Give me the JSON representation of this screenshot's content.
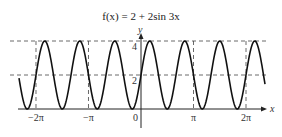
{
  "chart_data": {
    "type": "line",
    "title": "f(x) = 2 + 2sin 3x",
    "function": "2 + 2*sin(3*x)",
    "xlabel": "x",
    "ylabel": "y",
    "x_range": [
      -7.3,
      7.42
    ],
    "ylim": [
      0,
      4
    ],
    "x_ticks": [
      {
        "value": -6.2832,
        "label": "−2π"
      },
      {
        "value": -3.1416,
        "label": "−π"
      },
      {
        "value": 0,
        "label": "0"
      },
      {
        "value": 3.1416,
        "label": "π"
      },
      {
        "value": 6.2832,
        "label": "2π"
      }
    ],
    "y_ticks": [
      {
        "value": 2,
        "label": "2"
      },
      {
        "value": 4,
        "label": "4"
      }
    ],
    "reference_lines": {
      "horizontal_dashed": [
        2,
        4
      ],
      "vertical_dashed": [
        -6.2832,
        -3.1416,
        3.1416,
        6.2832
      ]
    },
    "grid": false,
    "legend": null
  },
  "labels": {
    "title": "f(x) = 2 + 2sin 3x",
    "x_axis": "x",
    "y_axis": "y",
    "tick_neg2pi": "−2π",
    "tick_negpi": "−π",
    "tick_zero": "0",
    "tick_pi": "π",
    "tick_2pi": "2π",
    "ytick_2": "2",
    "ytick_4": "4"
  }
}
